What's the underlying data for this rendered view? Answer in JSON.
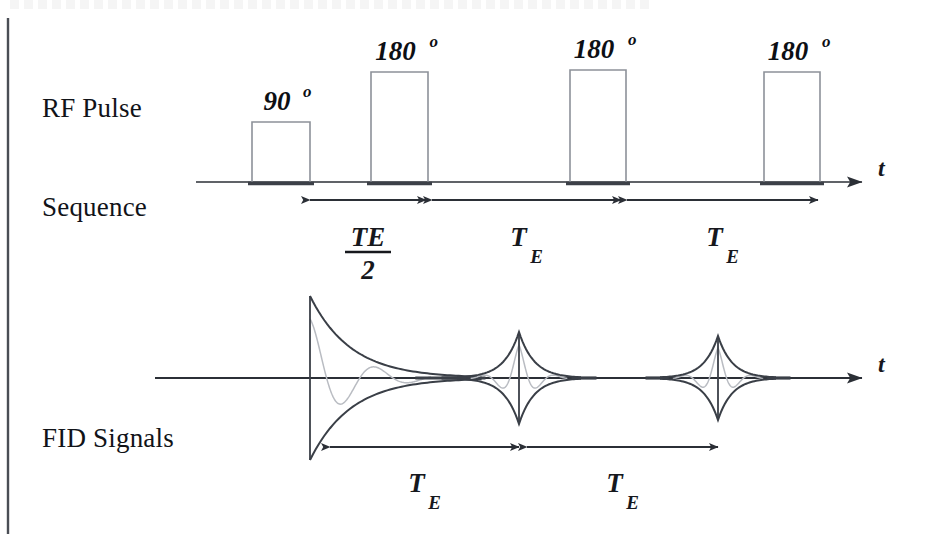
{
  "figure": {
    "title_fragment_top": "",
    "background_color": "#ffffff",
    "ink_color": "#2b2f36",
    "pulse_outline_color": "#8d9199",
    "envelope_color": "#3a3f47",
    "oscillation_color": "#b9bcc2"
  },
  "rows": {
    "rf": {
      "label_line1": "RF Pulse",
      "label_line2": "Sequence",
      "axis_label": "t"
    },
    "fid": {
      "label_line1": "FID Signals",
      "axis_label": "t"
    }
  },
  "pulses": [
    {
      "name": "excitation-pulse",
      "angle": "90",
      "degree_symbol": "o",
      "x": 252,
      "width": 58,
      "top": 122
    },
    {
      "name": "refocus-pulse-1",
      "angle": "180",
      "degree_symbol": "o",
      "x": 371,
      "width": 57,
      "top": 72
    },
    {
      "name": "refocus-pulse-2",
      "angle": "180",
      "degree_symbol": "o",
      "x": 570,
      "width": 56,
      "top": 70
    },
    {
      "name": "refocus-pulse-3",
      "angle": "180",
      "degree_symbol": "o",
      "x": 764,
      "width": 56,
      "top": 72
    }
  ],
  "rf_intervals": [
    {
      "name": "te-half-interval",
      "label_main": "TE",
      "label_denominator": "2",
      "is_fraction": true,
      "x1": 310,
      "x2": 426
    },
    {
      "name": "te-interval-1",
      "label_main": "T",
      "label_subscript": "E",
      "is_fraction": false,
      "x1": 432,
      "x2": 621
    },
    {
      "name": "te-interval-2",
      "label_main": "T",
      "label_subscript": "E",
      "is_fraction": false,
      "x1": 627,
      "x2": 818
    }
  ],
  "fid_intervals": [
    {
      "name": "fid-te-interval-1",
      "label_main": "T",
      "label_subscript": "E",
      "x1": 330,
      "x2": 519
    },
    {
      "name": "fid-te-interval-2",
      "label_main": "T",
      "label_subscript": "E",
      "x1": 527,
      "x2": 718
    }
  ],
  "fid_signals": [
    {
      "name": "free-induction-decay",
      "center": 310,
      "type": "decay",
      "amplitude": 82,
      "half_width": 78
    },
    {
      "name": "spin-echo-1",
      "center": 519,
      "type": "echo",
      "amplitude": 46,
      "half_width": 62
    },
    {
      "name": "spin-echo-2",
      "center": 718,
      "type": "echo",
      "amplitude": 42,
      "half_width": 58
    }
  ],
  "axes": {
    "rf_baseline_y": 182,
    "rf_axis_x1": 196,
    "rf_axis_x2": 862,
    "fid_baseline_y": 378,
    "fid_axis_x1": 155,
    "fid_axis_x2": 862
  },
  "border": {
    "name": "left-rule",
    "x": 8,
    "y1": 18,
    "y2": 534
  }
}
